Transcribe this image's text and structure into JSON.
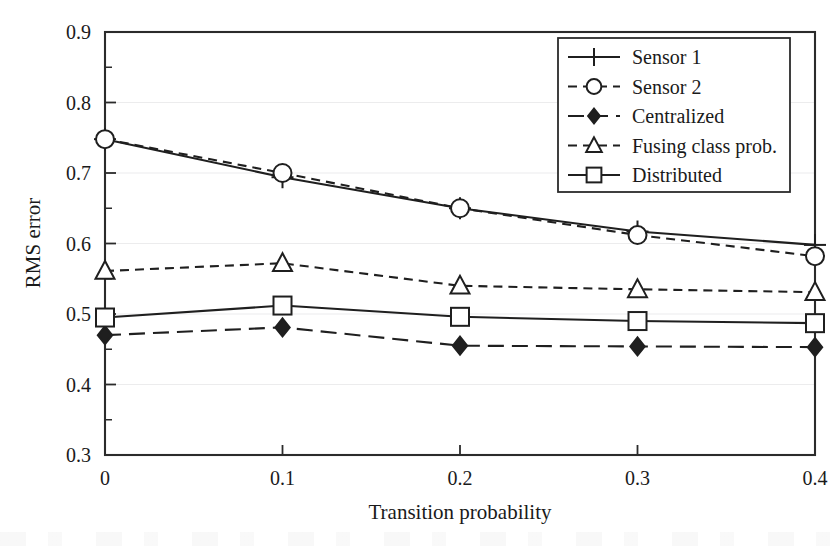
{
  "chart_data": {
    "type": "line",
    "title": "",
    "xlabel": "Transition probability",
    "ylabel": "RMS error",
    "xlim": [
      0,
      0.4
    ],
    "ylim": [
      0.3,
      0.9
    ],
    "grid": true,
    "legend_position": "top-right",
    "x": [
      0,
      0.1,
      0.2,
      0.3,
      0.4
    ],
    "xticklabels": [
      "0",
      "0.1",
      "0.2",
      "0.3",
      "0.4"
    ],
    "yticklabels": [
      "0.3",
      "0.4",
      "0.5",
      "0.6",
      "0.7",
      "0.8",
      "0.9"
    ],
    "yticks": [
      0.3,
      0.4,
      0.5,
      0.6,
      0.7,
      0.8,
      0.9
    ],
    "yminorticks": [
      0.35,
      0.45,
      0.55,
      0.65,
      0.75,
      0.85
    ],
    "series": [
      {
        "name": "Sensor 1",
        "marker": "plus",
        "dash": "solid",
        "values": [
          0.748,
          0.694,
          0.65,
          0.617,
          0.598
        ]
      },
      {
        "name": "Sensor 2",
        "marker": "circle",
        "dash": "dashed",
        "values": [
          0.748,
          0.7,
          0.65,
          0.612,
          0.582
        ]
      },
      {
        "name": "Centralized",
        "marker": "diamond",
        "dash": "long-dash",
        "values": [
          0.47,
          0.481,
          0.455,
          0.454,
          0.453
        ]
      },
      {
        "name": "Fusing class prob.",
        "marker": "triangle",
        "dash": "dashed",
        "values": [
          0.561,
          0.572,
          0.54,
          0.535,
          0.531
        ]
      },
      {
        "name": "Distributed",
        "marker": "square",
        "dash": "solid",
        "values": [
          0.495,
          0.512,
          0.496,
          0.49,
          0.487
        ]
      }
    ]
  },
  "colors": {
    "ink": "#1f1f1f",
    "frame": "#2b2b2b",
    "grid": "#ececed",
    "background": "#ffffff"
  }
}
